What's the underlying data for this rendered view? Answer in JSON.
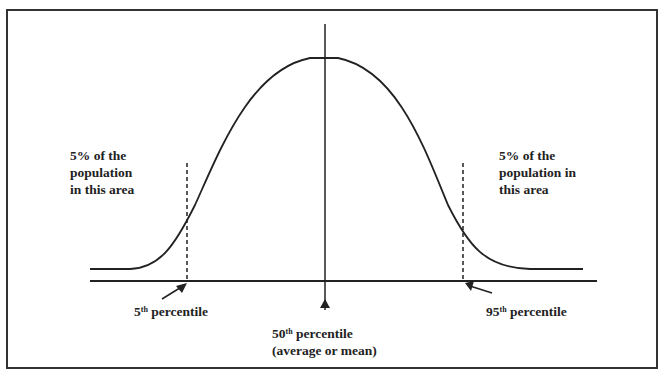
{
  "diagram": {
    "type": "normal-distribution-curve",
    "left_area_label": [
      "5% of the",
      "population",
      "in this area"
    ],
    "right_area_label": [
      "5% of the",
      "population in",
      "this area"
    ],
    "percentiles": [
      {
        "num": "5",
        "sup": "th",
        "text": " percentile"
      },
      {
        "num": "50",
        "sup": "th",
        "text": " percentile",
        "subtext": "(average or mean)"
      },
      {
        "num": "95",
        "sup": "th",
        "text": " percentile"
      }
    ],
    "colors": {
      "line": "#222222",
      "frame": "#333333",
      "background": "#ffffff"
    }
  }
}
